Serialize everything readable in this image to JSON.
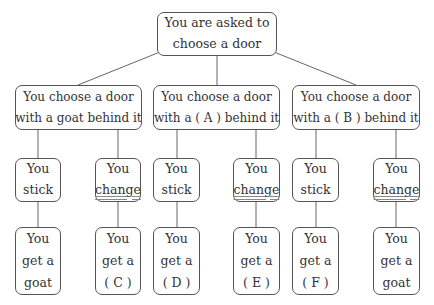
{
  "root": {
    "line1": "You are asked to",
    "line2": "choose a door"
  },
  "choices": [
    {
      "line1": "You choose a door",
      "line2": "with a goat behind it"
    },
    {
      "line1": "You choose a door",
      "line2": "with a ( A ) behind it"
    },
    {
      "line1": "You choose a door",
      "line2": "with a ( B ) behind it"
    }
  ],
  "actions": [
    {
      "line1": "You",
      "line2": "stick"
    },
    {
      "line1": "You",
      "line2": "change"
    },
    {
      "line1": "You",
      "line2": "stick"
    },
    {
      "line1": "You",
      "line2": "change"
    },
    {
      "line1": "You",
      "line2": "stick"
    },
    {
      "line1": "You",
      "line2": "change"
    }
  ],
  "outcomes": [
    {
      "line1": "You",
      "line2": "get a",
      "line3": "goat"
    },
    {
      "line1": "You",
      "line2": "get a",
      "line3": "( C )"
    },
    {
      "line1": "You",
      "line2": "get a",
      "line3": "( D )"
    },
    {
      "line1": "You",
      "line2": "get a",
      "line3": "( E )"
    },
    {
      "line1": "You",
      "line2": "get a",
      "line3": "( F )"
    },
    {
      "line1": "You",
      "line2": "get a",
      "line3": "goat"
    }
  ],
  "colors": {
    "border": "#555555",
    "line": "#666666",
    "text": "#333333"
  }
}
